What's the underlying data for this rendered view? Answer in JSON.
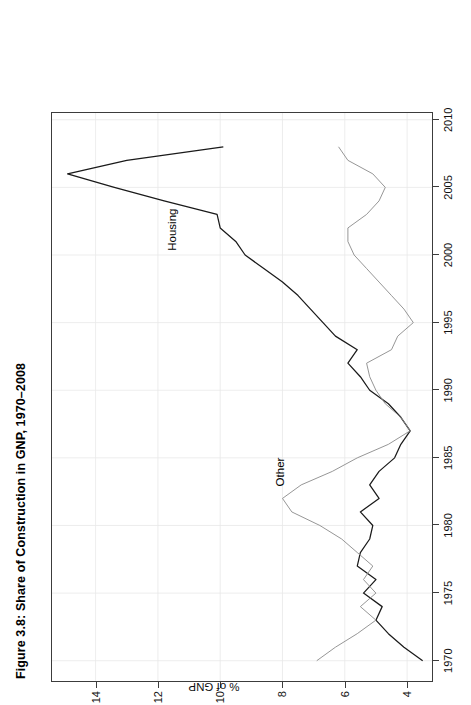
{
  "figure": {
    "title": "Figure 3.8: Share of Construction in GNP, 1970–2008",
    "rotation": "90deg-counterclockwise",
    "page_background": "#ffffff"
  },
  "axes": {
    "y_title": "% of GNP",
    "y_ticks": [
      "4",
      "6",
      "8",
      "10",
      "12",
      "14"
    ],
    "x_ticks": [
      "1970",
      "1975",
      "1980",
      "1985",
      "1990",
      "1995",
      "2000",
      "2005",
      "2010"
    ]
  },
  "annotations": [
    {
      "name": "housing-label",
      "text": "Housing"
    },
    {
      "name": "other-label",
      "text": "Other"
    }
  ],
  "chart_data": {
    "type": "line",
    "title": "Figure 3.8: Share of Construction in GNP, 1970–2008",
    "xlabel": "",
    "ylabel": "% of GNP",
    "xlim": [
      1968.5,
      2010.5
    ],
    "ylim": [
      3.2,
      15.4
    ],
    "xticks": [
      1970,
      1975,
      1980,
      1985,
      1990,
      1995,
      2000,
      2005,
      2010
    ],
    "yticks": [
      4,
      6,
      8,
      10,
      12,
      14
    ],
    "grid": true,
    "legend": "inline-labels",
    "x": [
      1970,
      1971,
      1972,
      1973,
      1974,
      1975,
      1976,
      1977,
      1978,
      1979,
      1980,
      1981,
      1982,
      1983,
      1984,
      1985,
      1986,
      1987,
      1988,
      1989,
      1990,
      1991,
      1992,
      1993,
      1994,
      1995,
      1996,
      1997,
      1998,
      1999,
      2000,
      2001,
      2002,
      2003,
      2004,
      2005,
      2006,
      2007,
      2008
    ],
    "series": [
      {
        "name": "Housing",
        "color": "#1a1a1a",
        "values": [
          3.5,
          4.1,
          4.6,
          5.0,
          4.8,
          5.4,
          5.0,
          5.6,
          5.5,
          5.2,
          5.1,
          5.5,
          4.9,
          5.2,
          4.9,
          4.4,
          4.2,
          3.9,
          4.2,
          4.6,
          5.2,
          5.5,
          5.9,
          5.6,
          6.3,
          6.7,
          7.1,
          7.5,
          8.0,
          8.6,
          9.2,
          9.5,
          10.0,
          10.1,
          11.8,
          13.4,
          14.9,
          13.0,
          9.9
        ]
      },
      {
        "name": "Other",
        "color": "#8a8a8a",
        "values": [
          6.9,
          6.3,
          5.6,
          5.0,
          5.5,
          5.0,
          5.4,
          5.1,
          5.6,
          6.1,
          6.8,
          7.7,
          8.0,
          7.4,
          6.4,
          5.6,
          4.6,
          3.9,
          4.2,
          4.7,
          5.0,
          5.2,
          5.3,
          4.5,
          4.3,
          3.8,
          4.1,
          4.5,
          4.9,
          5.3,
          5.7,
          5.9,
          5.9,
          5.3,
          4.9,
          4.7,
          5.1,
          5.9,
          6.2
        ]
      }
    ]
  }
}
